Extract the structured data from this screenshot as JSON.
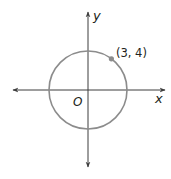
{
  "diagram": {
    "type": "coordinate-plane-circle",
    "labels": {
      "x_axis": "x",
      "y_axis": "y",
      "origin": "O",
      "point": "(3, 4)"
    },
    "circle": {
      "center": [
        0,
        0
      ],
      "radius": 5,
      "stroke_color": "#8c8c8c"
    },
    "point": {
      "x": 3,
      "y": 4,
      "color": "#8c8c8c"
    },
    "axis_color": "#3c3c3c"
  }
}
